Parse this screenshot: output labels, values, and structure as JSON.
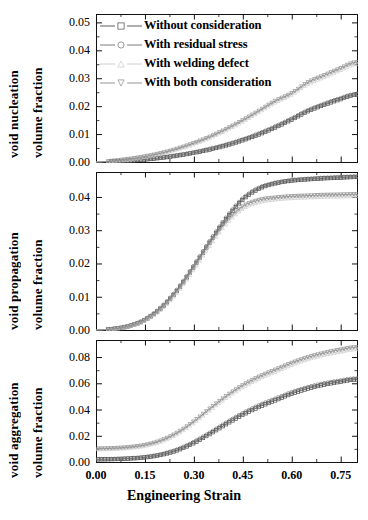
{
  "figure": {
    "xlabel": "Engineering Strain",
    "panels": [
      {
        "id": "nucleation",
        "ylabel_line1": "void nucleation",
        "ylabel_line2": "volume fraction",
        "yticks": [
          "0.00",
          "0.01",
          "0.02",
          "0.03",
          "0.04",
          "0.05"
        ],
        "ylim": [
          0.0,
          0.053
        ]
      },
      {
        "id": "propagation",
        "ylabel_line1": "void propagation",
        "ylabel_line2": "volume fraction",
        "yticks": [
          "0.00",
          "0.01",
          "0.02",
          "0.03",
          "0.04"
        ],
        "ylim": [
          0.0,
          0.0475
        ]
      },
      {
        "id": "aggregation",
        "ylabel_line1": "void aggregation",
        "ylabel_line2": "volume fraction",
        "yticks": [
          "0.00",
          "0.02",
          "0.04",
          "0.06",
          "0.08"
        ],
        "ylim": [
          0.0,
          0.093
        ]
      }
    ],
    "xticks": [
      "0.00",
      "0.15",
      "0.30",
      "0.45",
      "0.60",
      "0.75"
    ],
    "xlim": [
      0.0,
      0.8
    ],
    "legend": [
      {
        "label": "Without consideration",
        "marker": "square",
        "color": "#4a4a4a"
      },
      {
        "label": "With residual stress",
        "marker": "circle",
        "color": "#6e6e6e"
      },
      {
        "label": "With welding defect",
        "marker": "triangle-up",
        "color": "#c8c8c8"
      },
      {
        "label": "With both consideration",
        "marker": "triangle-down",
        "color": "#8a8a8a"
      }
    ]
  },
  "chart_data": {
    "type": "line",
    "title": "",
    "xlabel": "Engineering Strain",
    "xlim": [
      0.0,
      0.8
    ],
    "grid": false,
    "legend_position": "top-left",
    "subplots": [
      {
        "name": "void nucleation",
        "ylabel": "void nucleation volume fraction",
        "ylim": [
          0.0,
          0.053
        ],
        "yticks": [
          0.0,
          0.01,
          0.02,
          0.03,
          0.04,
          0.05
        ],
        "x": [
          0.0,
          0.05,
          0.1,
          0.15,
          0.2,
          0.25,
          0.3,
          0.35,
          0.4,
          0.45,
          0.5,
          0.55,
          0.6,
          0.65,
          0.7,
          0.75,
          0.79
        ],
        "series": [
          {
            "name": "Without consideration",
            "marker": "square",
            "values": [
              0.0,
              0.0002,
              0.0005,
              0.0009,
              0.0015,
              0.0023,
              0.0033,
              0.0045,
              0.006,
              0.0078,
              0.0099,
              0.0124,
              0.0152,
              0.0182,
              0.0205,
              0.0225,
              0.024
            ]
          },
          {
            "name": "With residual stress",
            "marker": "circle",
            "values": [
              0.0,
              0.0002,
              0.0005,
              0.001,
              0.0016,
              0.0025,
              0.0035,
              0.0048,
              0.0063,
              0.0081,
              0.0103,
              0.0128,
              0.0156,
              0.0186,
              0.0209,
              0.0229,
              0.0243
            ]
          },
          {
            "name": "With welding defect",
            "marker": "triangle-up",
            "values": [
              0.0,
              0.0004,
              0.001,
              0.0019,
              0.0031,
              0.0046,
              0.0065,
              0.0088,
              0.0115,
              0.0146,
              0.018,
              0.0214,
              0.0242,
              0.028,
              0.0305,
              0.033,
              0.035
            ]
          },
          {
            "name": "With both consideration",
            "marker": "triangle-down",
            "values": [
              0.0,
              0.0004,
              0.0011,
              0.002,
              0.0032,
              0.0048,
              0.0068,
              0.0091,
              0.0119,
              0.015,
              0.0184,
              0.0219,
              0.0247,
              0.0286,
              0.0311,
              0.0336,
              0.0356
            ]
          }
        ]
      },
      {
        "name": "void propagation",
        "ylabel": "void propagation volume fraction",
        "ylim": [
          0.0,
          0.0475
        ],
        "yticks": [
          0.0,
          0.01,
          0.02,
          0.03,
          0.04
        ],
        "x": [
          0.0,
          0.05,
          0.1,
          0.15,
          0.2,
          0.25,
          0.3,
          0.35,
          0.4,
          0.45,
          0.5,
          0.55,
          0.6,
          0.65,
          0.7,
          0.75,
          0.79
        ],
        "series": [
          {
            "name": "Without consideration",
            "marker": "square",
            "values": [
              0.0,
              0.0003,
              0.0011,
              0.003,
              0.0066,
              0.012,
              0.019,
              0.0265,
              0.0335,
              0.0392,
              0.0425,
              0.0441,
              0.0449,
              0.0453,
              0.0456,
              0.0458,
              0.046
            ]
          },
          {
            "name": "With residual stress",
            "marker": "circle",
            "values": [
              0.0,
              0.0003,
              0.0012,
              0.0032,
              0.0069,
              0.0124,
              0.0195,
              0.027,
              0.034,
              0.0396,
              0.0428,
              0.0443,
              0.0451,
              0.0455,
              0.0458,
              0.046,
              0.0462
            ]
          },
          {
            "name": "With welding defect",
            "marker": "triangle-up",
            "values": [
              0.0,
              0.0003,
              0.0011,
              0.0029,
              0.0063,
              0.0115,
              0.0183,
              0.0256,
              0.032,
              0.0365,
              0.0385,
              0.0393,
              0.0397,
              0.0399,
              0.0401,
              0.0402,
              0.0403
            ]
          },
          {
            "name": "With both consideration",
            "marker": "triangle-down",
            "values": [
              0.0,
              0.0003,
              0.0012,
              0.0031,
              0.0067,
              0.0121,
              0.019,
              0.0264,
              0.0328,
              0.0372,
              0.0391,
              0.0398,
              0.0402,
              0.0404,
              0.0406,
              0.0407,
              0.0408
            ]
          }
        ]
      },
      {
        "name": "void aggregation",
        "ylabel": "void aggregation volume fraction",
        "ylim": [
          0.0,
          0.093
        ],
        "yticks": [
          0.0,
          0.02,
          0.04,
          0.06,
          0.08
        ],
        "x": [
          0.0,
          0.05,
          0.1,
          0.15,
          0.2,
          0.25,
          0.3,
          0.35,
          0.4,
          0.45,
          0.5,
          0.55,
          0.6,
          0.65,
          0.7,
          0.75,
          0.79
        ],
        "series": [
          {
            "name": "Without consideration",
            "marker": "square",
            "values": [
              0.002,
              0.0022,
              0.0026,
              0.0035,
              0.0055,
              0.009,
              0.0145,
              0.0215,
              0.029,
              0.036,
              0.042,
              0.047,
              0.052,
              0.056,
              0.059,
              0.0612,
              0.0628
            ]
          },
          {
            "name": "With residual stress",
            "marker": "circle",
            "values": [
              0.0022,
              0.0024,
              0.0029,
              0.0039,
              0.006,
              0.0097,
              0.0154,
              0.0226,
              0.0302,
              0.0373,
              0.0434,
              0.0484,
              0.0533,
              0.0572,
              0.0601,
              0.0622,
              0.0637
            ]
          },
          {
            "name": "With welding defect",
            "marker": "triangle-up",
            "values": [
              0.0098,
              0.0101,
              0.0108,
              0.0124,
              0.0158,
              0.0216,
              0.03,
              0.0398,
              0.0492,
              0.0572,
              0.0637,
              0.069,
              0.0742,
              0.0785,
              0.0818,
              0.0843,
              0.086
            ]
          },
          {
            "name": "With both consideration",
            "marker": "triangle-down",
            "values": [
              0.0102,
              0.0105,
              0.0113,
              0.013,
              0.0165,
              0.0225,
              0.0311,
              0.041,
              0.0505,
              0.0586,
              0.0651,
              0.0704,
              0.0756,
              0.0799,
              0.0832,
              0.0857,
              0.0874
            ]
          }
        ]
      }
    ]
  }
}
